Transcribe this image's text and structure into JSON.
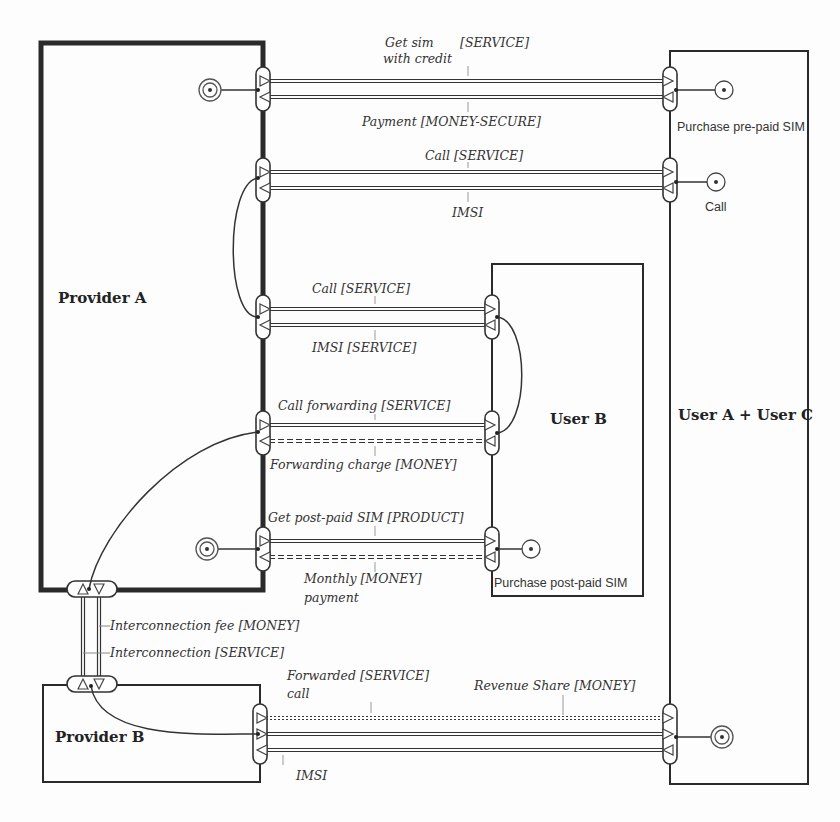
{
  "diagram": {
    "type": "e3-value value model",
    "colors": {
      "stroke": "#333333",
      "thin_stroke": "#444444",
      "text": "#333333",
      "background": "#fdfdfd"
    },
    "actors": [
      {
        "id": "provider_a",
        "label": "Provider A",
        "x": 41,
        "y": 43,
        "w": 222,
        "h": 547,
        "stroke_width": 5,
        "label_x": 58,
        "label_y": 303
      },
      {
        "id": "provider_b",
        "label": "Provider B",
        "x": 43,
        "y": 685,
        "w": 217,
        "h": 97,
        "stroke_width": 2,
        "label_x": 55,
        "label_y": 742
      },
      {
        "id": "user_b",
        "label": "User B",
        "x": 492,
        "y": 264,
        "w": 151,
        "h": 332,
        "stroke_width": 2,
        "label_x": 550,
        "label_y": 424
      },
      {
        "id": "user_ac",
        "label": "User A + User C",
        "x": 670,
        "y": 51,
        "w": 138,
        "h": 733,
        "stroke_width": 2,
        "label_x": 678,
        "label_y": 420
      }
    ],
    "needs": [
      {
        "id": "purchase_prepaid",
        "label": "Purchase pre-paid SIM",
        "cx": 724,
        "cy": 90,
        "label_x": 677,
        "label_y": 131
      },
      {
        "id": "call",
        "label": "Call",
        "cx": 716,
        "cy": 182,
        "label_x": 705,
        "label_y": 211
      },
      {
        "id": "purchase_postpaid",
        "label": "Purchase post-paid SIM",
        "cx": 531,
        "cy": 549,
        "label_x": 494,
        "label_y": 587
      }
    ],
    "start_stimuli": [
      {
        "id": "start_a_prepaid",
        "cx": 210,
        "cy": 90
      },
      {
        "id": "start_a_postpaid",
        "cx": 207,
        "cy": 549
      },
      {
        "id": "end_ac",
        "cx": 722,
        "cy": 737
      }
    ],
    "value_exchanges": [
      {
        "id": "prepaid_sim",
        "from_x": 263,
        "to_x": 670,
        "flows": [
          {
            "label": "Get sim with credit [SERVICE]",
            "y": 81,
            "direction": "right",
            "style": "solid"
          },
          {
            "label": "Payment [MONEY-SECURE]",
            "y": 97,
            "direction": "left",
            "style": "solid"
          }
        ],
        "labels": [
          {
            "text": "Get sim",
            "x": 385,
            "y": 47
          },
          {
            "text": "[SERVICE]",
            "x": 460,
            "y": 47
          },
          {
            "text": "with credit",
            "x": 383,
            "y": 63
          },
          {
            "text": "Payment [MONEY-SECURE]",
            "x": 362,
            "y": 126
          }
        ]
      },
      {
        "id": "call_a",
        "from_x": 263,
        "to_x": 670,
        "flows": [
          {
            "label": "Call [SERVICE]",
            "y": 172,
            "direction": "right",
            "style": "solid"
          },
          {
            "label": "IMSI",
            "y": 188,
            "direction": "left",
            "style": "solid"
          }
        ],
        "labels": [
          {
            "text": "Call [SERVICE]",
            "x": 425,
            "y": 160
          },
          {
            "text": "IMSI",
            "x": 452,
            "y": 217
          }
        ]
      },
      {
        "id": "call_b",
        "from_x": 263,
        "to_x": 492,
        "flows": [
          {
            "label": "Call [SERVICE]",
            "y": 309,
            "direction": "right",
            "style": "solid"
          },
          {
            "label": "IMSI [SERVICE]",
            "y": 325,
            "direction": "left",
            "style": "solid"
          }
        ],
        "labels": [
          {
            "text": "Call [SERVICE]",
            "x": 312,
            "y": 293
          },
          {
            "text": "IMSI [SERVICE]",
            "x": 312,
            "y": 352
          }
        ]
      },
      {
        "id": "call_forwarding",
        "from_x": 263,
        "to_x": 492,
        "flows": [
          {
            "label": "Call forwarding [SERVICE]",
            "y": 425,
            "direction": "right",
            "style": "solid"
          },
          {
            "label": "Forwarding charge [MONEY]",
            "y": 441,
            "direction": "left",
            "style": "dashed"
          }
        ],
        "labels": [
          {
            "text": "Call forwarding [SERVICE]",
            "x": 278,
            "y": 410
          },
          {
            "text": "Forwarding charge [MONEY]",
            "x": 270,
            "y": 469
          }
        ]
      },
      {
        "id": "postpaid_sim",
        "from_x": 263,
        "to_x": 492,
        "flows": [
          {
            "label": "Get post-paid SIM [PRODUCT]",
            "y": 541,
            "direction": "right",
            "style": "solid"
          },
          {
            "label": "Monthly payment [MONEY]",
            "y": 557,
            "direction": "left",
            "style": "dashed"
          }
        ],
        "labels": [
          {
            "text": "Get post-paid SIM [PRODUCT]",
            "x": 268,
            "y": 522
          },
          {
            "text": "Monthly [MONEY]",
            "x": 304,
            "y": 583
          },
          {
            "text": "payment",
            "x": 304,
            "y": 602
          }
        ]
      },
      {
        "id": "forwarded_call",
        "from_x": 260,
        "to_x": 670,
        "flows": [
          {
            "label": "Revenue Share [MONEY]",
            "y": 718,
            "direction": "right",
            "style": "dotted"
          },
          {
            "label": "Forwarded call [SERVICE]",
            "y": 734,
            "direction": "right",
            "style": "solid"
          },
          {
            "label": "IMSI",
            "y": 750,
            "direction": "left",
            "style": "solid"
          }
        ],
        "labels": [
          {
            "text": "Forwarded [SERVICE]",
            "x": 287,
            "y": 680
          },
          {
            "text": "call",
            "x": 287,
            "y": 698
          },
          {
            "text": "Revenue Share [MONEY]",
            "x": 474,
            "y": 690
          },
          {
            "text": "IMSI",
            "x": 296,
            "y": 780
          }
        ]
      },
      {
        "id": "interconnection",
        "orientation": "vertical",
        "from_y": 590,
        "to_y": 685,
        "flows": [
          {
            "label": "Interconnection fee [MONEY]",
            "x": 83,
            "direction": "up",
            "style": "solid"
          },
          {
            "label": "Interconnection [SERVICE]",
            "x": 99,
            "direction": "down",
            "style": "solid"
          }
        ],
        "labels": [
          {
            "text": "Interconnection fee [MONEY]",
            "x": 110,
            "y": 630
          },
          {
            "text": "Interconnection [SERVICE]",
            "x": 110,
            "y": 657
          }
        ]
      }
    ]
  }
}
